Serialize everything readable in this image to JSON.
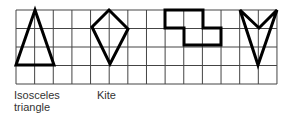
{
  "grid": {
    "x0": 16,
    "y0": 10,
    "cols": 14,
    "rows": 4,
    "cell_w": 18.64,
    "cell_h": 18.5,
    "line_color": "#444444"
  },
  "shapes": [
    {
      "name": "isosceles-triangle",
      "points": [
        [
          35,
          10
        ],
        [
          54,
          65
        ],
        [
          16,
          65
        ]
      ]
    },
    {
      "name": "kite",
      "points": [
        [
          109,
          10
        ],
        [
          128,
          29
        ],
        [
          110,
          64
        ],
        [
          92,
          27
        ]
      ]
    },
    {
      "name": "step-shape",
      "points": [
        [
          165,
          10
        ],
        [
          203,
          10
        ],
        [
          203,
          28
        ],
        [
          221,
          28
        ],
        [
          221,
          45
        ],
        [
          184,
          45
        ],
        [
          184,
          28
        ],
        [
          165,
          28
        ]
      ]
    },
    {
      "name": "arrowhead",
      "points": [
        [
          240,
          10
        ],
        [
          259,
          28
        ],
        [
          277,
          10
        ],
        [
          258,
          65
        ]
      ]
    }
  ],
  "shape_style": {
    "stroke": "#000000",
    "stroke_width": 3
  },
  "labels": {
    "triangle_line1": "Isosceles",
    "triangle_line2": "triangle",
    "kite": "Kite"
  }
}
